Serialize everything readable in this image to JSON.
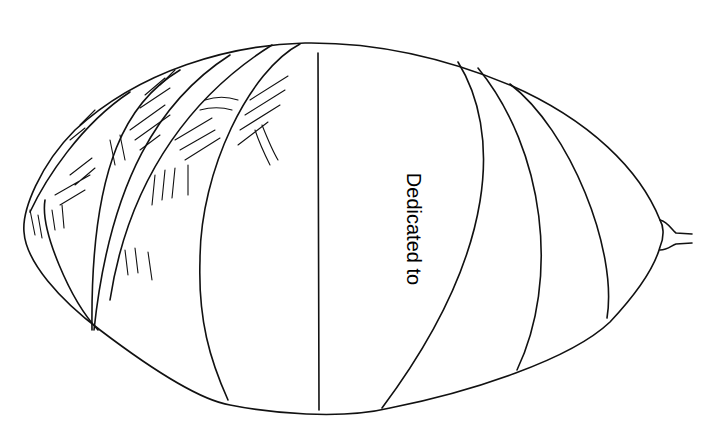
{
  "page": {
    "dedication_text": "Dedicated to"
  },
  "illustration": {
    "subject": "balloon-outline-drawing",
    "stroke_color": "#111111",
    "background_color": "#ffffff"
  }
}
